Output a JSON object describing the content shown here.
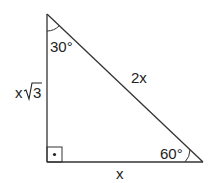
{
  "diagram": {
    "type": "right-triangle-30-60-90",
    "labels": {
      "top_angle": "30°",
      "right_angle": "60°",
      "hypotenuse": "2x",
      "base": "x",
      "vertical_side_prefix": "x",
      "vertical_side_radicand": "3"
    },
    "colors": {
      "stroke": "#333333",
      "text": "#222222",
      "background": "#ffffff"
    }
  }
}
